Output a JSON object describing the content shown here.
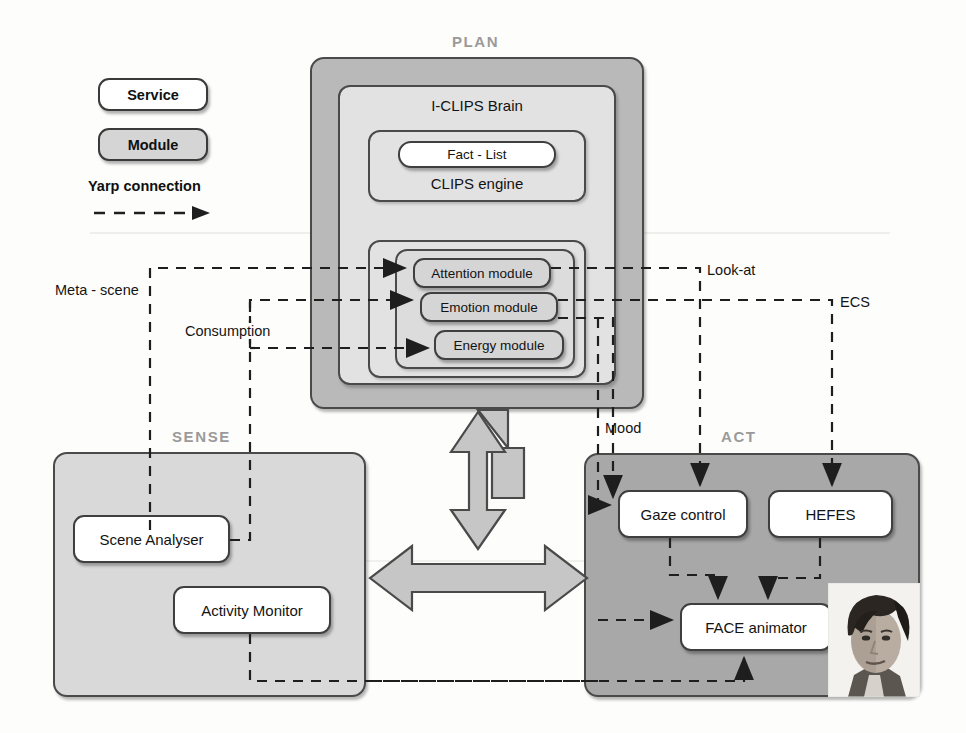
{
  "diagram": {
    "colors": {
      "plan_fill": "#b9b9b9",
      "sense_fill": "#d9d9d9",
      "act_fill": "#a8a8a8",
      "nest_fill": "#e2e2e2",
      "service_fill": "#ffffff",
      "module_fill": "#d5d5d5",
      "stroke": "#3f3f3f",
      "container_label": "#9a9a9a",
      "arrow_hub_fill": "#c6c6c6",
      "wire": "#1e1e1e"
    }
  },
  "legend": {
    "service_label": "Service",
    "module_label": "Module",
    "connection_label": "Yarp connection",
    "connection_icon": "dashed-arrow-icon"
  },
  "containers": {
    "plan": {
      "label": "PLAN"
    },
    "sense": {
      "label": "SENSE"
    },
    "act": {
      "label": "ACT"
    }
  },
  "plan": {
    "brain_label": "I-CLIPS Brain",
    "engine_label": "CLIPS engine",
    "fact_list_label": "Fact - List",
    "modules": [
      {
        "label": "Attention module"
      },
      {
        "label": "Emotion module"
      },
      {
        "label": "Energy module"
      }
    ]
  },
  "sense": {
    "services": [
      {
        "label": "Scene Analyser"
      },
      {
        "label": "Activity Monitor"
      }
    ]
  },
  "act": {
    "services": [
      {
        "label": "Gaze control"
      },
      {
        "label": "HEFES"
      },
      {
        "label": "FACE animator"
      }
    ],
    "photo": {
      "name": "face-robot-photo",
      "alt": "FACE android head photograph"
    }
  },
  "connections": [
    {
      "label": "Meta - scene"
    },
    {
      "label": "Consumption"
    },
    {
      "label": "Look-at"
    },
    {
      "label": "ECS"
    },
    {
      "label": "Mood"
    }
  ]
}
